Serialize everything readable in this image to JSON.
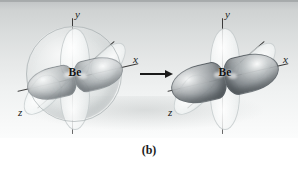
{
  "figure": {
    "caption": "(b)",
    "panel_background": "#dfe2e2"
  },
  "arrow": {
    "name": "transformation-arrow",
    "direction": "right",
    "color": "#1a1a1a"
  },
  "diagrams": [
    {
      "id": "before",
      "role": "unhybridized-beryllium-orbitals",
      "atom_label": "Be",
      "axes": [
        {
          "name": "y",
          "label": "y"
        },
        {
          "name": "x",
          "label": "x"
        },
        {
          "name": "z",
          "label": "z"
        }
      ],
      "has_sphere": true,
      "sphere_color": "#cdd2d3",
      "lobe_color_dark": "#6e757a",
      "lobe_color_pale": "#f2f5f5"
    },
    {
      "id": "after",
      "role": "sp-hybrid-beryllium-orbitals",
      "atom_label": "Be",
      "axes": [
        {
          "name": "y",
          "label": "y"
        },
        {
          "name": "x",
          "label": "x"
        },
        {
          "name": "z",
          "label": "z"
        }
      ],
      "has_sphere": false,
      "lobe_color_dark": "#4e555a",
      "lobe_color_pale": "#f5f7f7"
    }
  ]
}
